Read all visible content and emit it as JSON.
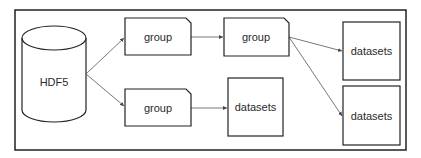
{
  "diagram": {
    "colors": {
      "stroke": "#222222",
      "arrow": "#555555",
      "background": "#ffffff"
    },
    "root": {
      "label": "HDF5",
      "shape": "cylinder"
    },
    "nodes": [
      {
        "id": "group1",
        "label": "group",
        "shape": "dog-ear-rect"
      },
      {
        "id": "group2",
        "label": "group",
        "shape": "dog-ear-rect"
      },
      {
        "id": "group3",
        "label": "group",
        "shape": "dog-ear-rect"
      },
      {
        "id": "datasets1",
        "label": "datasets",
        "shape": "rect"
      },
      {
        "id": "datasets2",
        "label": "datasets",
        "shape": "rect"
      },
      {
        "id": "datasets3",
        "label": "datasets",
        "shape": "rect"
      }
    ],
    "edges": [
      {
        "from": "HDF5",
        "to": "group1"
      },
      {
        "from": "HDF5",
        "to": "group3"
      },
      {
        "from": "group1",
        "to": "group2"
      },
      {
        "from": "group2",
        "to": "datasets2"
      },
      {
        "from": "group2",
        "to": "datasets3"
      },
      {
        "from": "group3",
        "to": "datasets1"
      }
    ]
  }
}
